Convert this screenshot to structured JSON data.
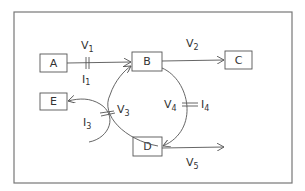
{
  "diagram": {
    "nodes": [
      {
        "id": "A",
        "label": "A"
      },
      {
        "id": "B",
        "label": "B"
      },
      {
        "id": "C",
        "label": "C"
      },
      {
        "id": "D",
        "label": "D"
      },
      {
        "id": "E",
        "label": "E"
      }
    ],
    "edges": [
      {
        "from": "A",
        "to": "B",
        "voltage": "V",
        "voltage_sub": "1",
        "current": "I",
        "current_sub": "1"
      },
      {
        "from": "B",
        "to": "C",
        "voltage": "V",
        "voltage_sub": "2"
      },
      {
        "from": "D",
        "to": "E",
        "voltage": "V",
        "voltage_sub": "3",
        "current": "I",
        "current_sub": "3"
      },
      {
        "from": "B",
        "to": "D",
        "voltage": "V",
        "voltage_sub": "4",
        "current": "I",
        "current_sub": "4"
      },
      {
        "from": "D",
        "to": "out",
        "voltage": "V",
        "voltage_sub": "5"
      }
    ]
  }
}
